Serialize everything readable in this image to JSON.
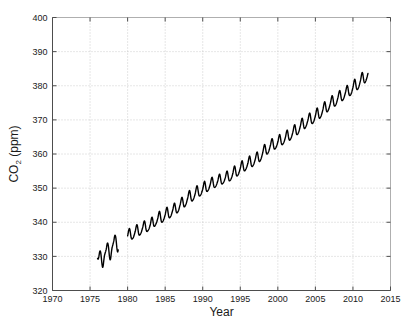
{
  "figure": {
    "width": 411,
    "height": 325,
    "background": "#ffffff",
    "line_color": "#000000",
    "grid_color": "#b9b9b9",
    "axis_color": "#4d4d4d"
  },
  "axes": {
    "x_title": "Year",
    "y_title_main": "CO",
    "y_title_sub": "2",
    "y_title_unit": " (ppm)",
    "y_title_full": "CO2 (ppm)"
  },
  "chart_data": {
    "type": "line",
    "title": "",
    "subtitle": "",
    "xlabel": "Year",
    "ylabel": "CO2 (ppm)",
    "xlim": [
      1970,
      2015
    ],
    "ylim": [
      320,
      400
    ],
    "xticks": [
      1970,
      1975,
      1980,
      1985,
      1990,
      1995,
      2000,
      2005,
      2010,
      2015
    ],
    "xticklabels": [
      "1970",
      "1975",
      "1980",
      "1985",
      "1990",
      "1995",
      "2000",
      "2005",
      "2010",
      "2015"
    ],
    "yticks": [
      320,
      330,
      340,
      350,
      360,
      370,
      380,
      390,
      400
    ],
    "yticklabels": [
      "320",
      "330",
      "340",
      "350",
      "360",
      "370",
      "380",
      "390",
      "400"
    ],
    "grid": true,
    "grid_style": "dotted",
    "legend": null,
    "legend_position": "none",
    "annotations": [],
    "series": [
      {
        "name": "Atmospheric CO2 (monthly mean)",
        "color": "#000000",
        "segments": [
          {
            "name": "segment-1",
            "x_start": 1976.0,
            "x_end": 1978.8,
            "x": [
              1976.0,
              1976.08,
              1976.17,
              1976.25,
              1976.33,
              1976.42,
              1976.5,
              1976.58,
              1976.67,
              1976.75,
              1976.83,
              1976.92,
              1977.0,
              1977.08,
              1977.17,
              1977.25,
              1977.33,
              1977.42,
              1977.5,
              1977.58,
              1977.67,
              1977.75,
              1977.83,
              1977.92,
              1978.0,
              1978.08,
              1978.17,
              1978.25,
              1978.33,
              1978.42,
              1978.5,
              1978.58,
              1978.67,
              1978.75
            ],
            "y": [
              329.4,
              329.2,
              329.9,
              331.0,
              331.6,
              331.1,
              329.6,
              327.9,
              326.8,
              327.3,
              328.8,
              330.2,
              330.9,
              331.5,
              332.3,
              333.4,
              333.9,
              333.3,
              331.8,
              330.0,
              329.0,
              329.5,
              331.0,
              332.4,
              333.1,
              333.8,
              334.6,
              335.7,
              336.2,
              335.6,
              334.1,
              332.3,
              331.3,
              331.9
            ]
          },
          {
            "name": "segment-2",
            "x_start": 1980.0,
            "x_end": 2012.0,
            "x": [
              1980.0,
              1980.25,
              1980.5,
              1980.75,
              1981.0,
              1981.25,
              1981.5,
              1981.75,
              1982.0,
              1982.25,
              1982.5,
              1982.75,
              1983.0,
              1983.25,
              1983.5,
              1983.75,
              1984.0,
              1984.25,
              1984.5,
              1984.75,
              1985.0,
              1985.25,
              1985.5,
              1985.75,
              1986.0,
              1986.25,
              1986.5,
              1986.75,
              1987.0,
              1987.25,
              1987.5,
              1987.75,
              1988.0,
              1988.25,
              1988.5,
              1988.75,
              1989.0,
              1989.25,
              1989.5,
              1989.75,
              1990.0,
              1990.25,
              1990.5,
              1990.75,
              1991.0,
              1991.25,
              1991.5,
              1991.75,
              1992.0,
              1992.25,
              1992.5,
              1992.75,
              1993.0,
              1993.25,
              1993.5,
              1993.75,
              1994.0,
              1994.25,
              1994.5,
              1994.75,
              1995.0,
              1995.25,
              1995.5,
              1995.75,
              1996.0,
              1996.25,
              1996.5,
              1996.75,
              1997.0,
              1997.25,
              1997.5,
              1997.75,
              1998.0,
              1998.25,
              1998.5,
              1998.75,
              1999.0,
              1999.25,
              1999.5,
              1999.75,
              2000.0,
              2000.25,
              2000.5,
              2000.75,
              2001.0,
              2001.25,
              2001.5,
              2001.75,
              2002.0,
              2002.25,
              2002.5,
              2002.75,
              2003.0,
              2003.25,
              2003.5,
              2003.75,
              2004.0,
              2004.25,
              2004.5,
              2004.75,
              2005.0,
              2005.25,
              2005.5,
              2005.75,
              2006.0,
              2006.25,
              2006.5,
              2006.75,
              2007.0,
              2007.25,
              2007.5,
              2007.75,
              2008.0,
              2008.25,
              2008.5,
              2008.75,
              2009.0,
              2009.25,
              2009.5,
              2009.75,
              2010.0,
              2010.25,
              2010.5,
              2010.75,
              2011.0,
              2011.25,
              2011.5,
              2011.75,
              2012.0
            ],
            "y": [
              336.0,
              338.2,
              335.3,
              335.5,
              337.2,
              339.3,
              336.4,
              336.7,
              338.4,
              340.4,
              337.5,
              337.7,
              339.1,
              341.5,
              338.9,
              339.4,
              341.0,
              343.2,
              340.2,
              340.5,
              342.2,
              344.4,
              341.5,
              341.8,
              343.5,
              345.6,
              342.9,
              343.3,
              345.2,
              347.3,
              344.6,
              345.2,
              347.1,
              349.3,
              346.4,
              346.7,
              348.4,
              350.7,
              347.9,
              348.1,
              349.7,
              352.0,
              349.2,
              349.5,
              351.1,
              353.2,
              350.4,
              350.6,
              352.1,
              354.1,
              351.4,
              351.6,
              353.0,
              355.0,
              352.3,
              352.6,
              354.2,
              356.5,
              353.7,
              354.1,
              355.8,
              358.0,
              355.2,
              355.6,
              357.2,
              359.4,
              356.5,
              356.8,
              358.5,
              360.6,
              357.9,
              358.5,
              360.5,
              362.8,
              360.1,
              360.6,
              362.4,
              364.5,
              361.6,
              361.9,
              363.5,
              365.7,
              362.9,
              363.2,
              364.8,
              367.0,
              364.2,
              364.6,
              366.4,
              368.6,
              365.8,
              366.3,
              368.2,
              370.5,
              367.6,
              368.1,
              369.9,
              372.0,
              369.1,
              369.4,
              371.2,
              373.5,
              370.6,
              371.1,
              373.0,
              375.3,
              372.5,
              373.0,
              374.9,
              377.1,
              374.2,
              374.6,
              376.5,
              378.6,
              375.8,
              376.2,
              378.0,
              380.1,
              377.3,
              377.6,
              379.5,
              381.9,
              379.0,
              379.5,
              381.5,
              383.9,
              381.0,
              381.6,
              383.6,
              386.0,
              383.2,
              383.9,
              385.9,
              388.1,
              385.4,
              386.2,
              388.9
            ]
          }
        ],
        "gap_range": [
          1978.8,
          1980.0
        ],
        "start_value": 329.4,
        "end_value": 388.9,
        "min_value": 326.8,
        "max_value": 388.9,
        "seasonal_amplitude_ppm": 6.0,
        "trend_description": "rising"
      }
    ]
  }
}
